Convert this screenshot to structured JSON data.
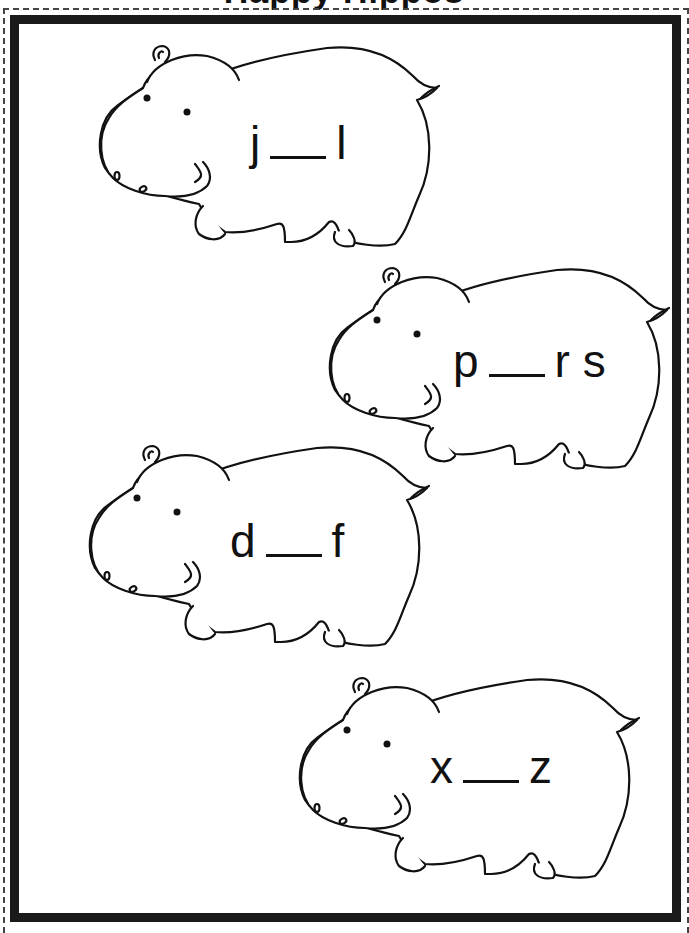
{
  "worksheet": {
    "title": "Happy Hippos",
    "instruction_visible": false,
    "colors": {
      "line": "#111111",
      "frame": "#1a1a1a",
      "background": "#ffffff"
    }
  },
  "hippos": [
    {
      "before": "j",
      "blank": "",
      "after": "l",
      "left": 95,
      "top": 36,
      "text_left": 155,
      "text_top": 80
    },
    {
      "before": "p",
      "blank": "",
      "after": "r s",
      "left": 325,
      "top": 258,
      "text_left": 128,
      "text_top": 76
    },
    {
      "before": "d",
      "blank": "",
      "after": "f",
      "left": 85,
      "top": 436,
      "text_left": 145,
      "text_top": 78
    },
    {
      "before": "x",
      "blank": "",
      "after": "z",
      "left": 295,
      "top": 668,
      "text_left": 135,
      "text_top": 72
    }
  ]
}
